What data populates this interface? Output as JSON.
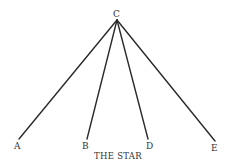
{
  "diagram": {
    "title": "THE STAR",
    "center": {
      "label": "C",
      "x": 117,
      "y": 20
    },
    "nodes": [
      {
        "label": "A",
        "x": 19,
        "y": 139
      },
      {
        "label": "B",
        "x": 87,
        "y": 139
      },
      {
        "label": "D",
        "x": 148,
        "y": 139
      },
      {
        "label": "E",
        "x": 215,
        "y": 141
      }
    ],
    "colors": {
      "line": "#2a2a2a",
      "text": "#333333",
      "background": "#ffffff"
    }
  }
}
